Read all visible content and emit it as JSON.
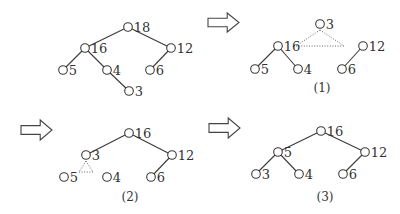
{
  "diagram": {
    "panels": [
      {
        "id": "p0",
        "caption": "",
        "nodes": [
          {
            "id": "n18",
            "label": "18",
            "x": 128,
            "y": 27
          },
          {
            "id": "n16",
            "label": "16",
            "x": 85,
            "y": 48
          },
          {
            "id": "n12",
            "label": "12",
            "x": 171,
            "y": 48
          },
          {
            "id": "n5",
            "label": "5",
            "x": 63,
            "y": 70
          },
          {
            "id": "n4",
            "label": "4",
            "x": 107,
            "y": 70
          },
          {
            "id": "n6",
            "label": "6",
            "x": 150,
            "y": 70
          },
          {
            "id": "n3",
            "label": "3",
            "x": 129,
            "y": 91
          }
        ],
        "edges": [
          [
            "n18",
            "n16"
          ],
          [
            "n18",
            "n12"
          ],
          [
            "n16",
            "n5"
          ],
          [
            "n16",
            "n4"
          ],
          [
            "n12",
            "n6"
          ],
          [
            "n4",
            "n3"
          ]
        ],
        "dotted": []
      },
      {
        "id": "p1",
        "caption": "(1)",
        "caption_pos": {
          "x": 322,
          "y": 92
        },
        "nodes": [
          {
            "id": "n3",
            "label": "3",
            "x": 320,
            "y": 24
          },
          {
            "id": "n16",
            "label": "16",
            "x": 278,
            "y": 46
          },
          {
            "id": "n12",
            "label": "12",
            "x": 363,
            "y": 46
          },
          {
            "id": "n5",
            "label": "5",
            "x": 255,
            "y": 69
          },
          {
            "id": "n4",
            "label": "4",
            "x": 298,
            "y": 69
          },
          {
            "id": "n6",
            "label": "6",
            "x": 342,
            "y": 69
          }
        ],
        "edges": [
          [
            "n16",
            "n5"
          ],
          [
            "n16",
            "n4"
          ],
          [
            "n12",
            "n6"
          ]
        ],
        "dotted": [
          [
            320,
            30,
            296,
            46
          ],
          [
            320,
            30,
            344,
            46
          ],
          [
            296,
            46,
            344,
            46
          ]
        ]
      },
      {
        "id": "p2",
        "caption": "(2)",
        "caption_pos": {
          "x": 130,
          "y": 201
        },
        "nodes": [
          {
            "id": "n16",
            "label": "16",
            "x": 129,
            "y": 133
          },
          {
            "id": "n3",
            "label": "3",
            "x": 86,
            "y": 155
          },
          {
            "id": "n12",
            "label": "12",
            "x": 172,
            "y": 155
          },
          {
            "id": "n5",
            "label": "5",
            "x": 64,
            "y": 177
          },
          {
            "id": "n4",
            "label": "4",
            "x": 107,
            "y": 177
          },
          {
            "id": "n6",
            "label": "6",
            "x": 151,
            "y": 177
          }
        ],
        "edges": [
          [
            "n16",
            "n3"
          ],
          [
            "n16",
            "n12"
          ],
          [
            "n12",
            "n6"
          ]
        ],
        "dotted": [
          [
            86,
            161,
            79,
            172
          ],
          [
            86,
            161,
            93,
            172
          ],
          [
            79,
            172,
            93,
            172
          ]
        ]
      },
      {
        "id": "p3",
        "caption": "(3)",
        "caption_pos": {
          "x": 325,
          "y": 201
        },
        "nodes": [
          {
            "id": "n16",
            "label": "16",
            "x": 321,
            "y": 131
          },
          {
            "id": "n5",
            "label": "5",
            "x": 278,
            "y": 152
          },
          {
            "id": "n12",
            "label": "12",
            "x": 365,
            "y": 152
          },
          {
            "id": "n3",
            "label": "3",
            "x": 256,
            "y": 174
          },
          {
            "id": "n4",
            "label": "4",
            "x": 299,
            "y": 174
          },
          {
            "id": "n6",
            "label": "6",
            "x": 343,
            "y": 174
          }
        ],
        "edges": [
          [
            "n16",
            "n5"
          ],
          [
            "n16",
            "n12"
          ],
          [
            "n5",
            "n3"
          ],
          [
            "n5",
            "n4"
          ],
          [
            "n12",
            "n6"
          ]
        ],
        "dotted": []
      }
    ],
    "arrows": [
      {
        "id": "arrow-to-1",
        "x": 208,
        "y": 13,
        "w": 31,
        "h": 19
      },
      {
        "id": "arrow-to-2",
        "x": 21,
        "y": 120,
        "w": 31,
        "h": 20
      },
      {
        "id": "arrow-to-3",
        "x": 209,
        "y": 118,
        "w": 31,
        "h": 20
      }
    ],
    "style": {
      "node_radius": 4.3,
      "line_color": "#3a3a3a",
      "background": "#ffffff"
    }
  }
}
